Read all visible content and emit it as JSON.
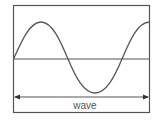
{
  "diagram": {
    "label": "wave",
    "colors": {
      "frame": "#555555",
      "wave": "#555555",
      "axis": "#555555",
      "arrow": "#555555",
      "background": "#ffffff"
    }
  }
}
